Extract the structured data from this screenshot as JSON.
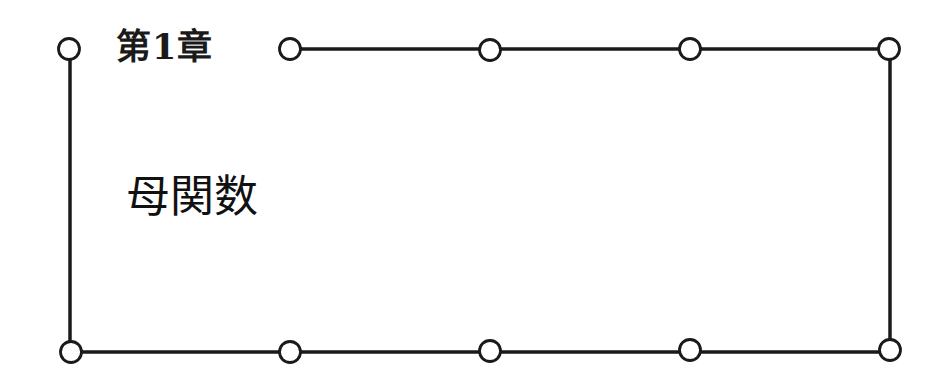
{
  "chapter": {
    "label": "第1章",
    "title": "母関数"
  },
  "frame": {
    "stroke_color": "#1a1a1a",
    "fill_color": "#ffffff",
    "top_nodes_x": [
      69,
      290,
      490,
      690,
      890
    ],
    "bottom_nodes_x": [
      71,
      290,
      490,
      690,
      890
    ],
    "top_y": 49,
    "bottom_y": 352
  }
}
